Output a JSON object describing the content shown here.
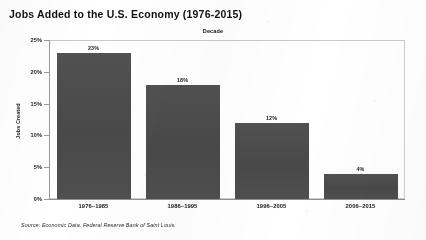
{
  "chart_data": {
    "type": "bar",
    "title": "Jobs Added to the U.S. Economy (1976-2015)",
    "xlabel": "Decade",
    "ylabel": "Jobs Created",
    "categories": [
      "1976–1985",
      "1986–1995",
      "1996–2005",
      "2006–2015"
    ],
    "values": [
      23,
      18,
      12,
      4
    ],
    "value_labels": [
      "23%",
      "18%",
      "12%",
      "4%"
    ],
    "ylim": [
      0,
      25
    ],
    "yticks": [
      0,
      5,
      10,
      15,
      20,
      25
    ],
    "ytick_labels": [
      "0%",
      "5%",
      "10%",
      "15%",
      "20%",
      "25%"
    ],
    "grid": false,
    "legend": "none",
    "xlabel_position": "top",
    "bar_color": "#4d4d4d",
    "axis_color": "#9a9a9a",
    "frame_color": "#cfcfcf"
  },
  "source": {
    "note": "Source: Economic Data. Federal Reserve Bank of Saint Louis."
  }
}
